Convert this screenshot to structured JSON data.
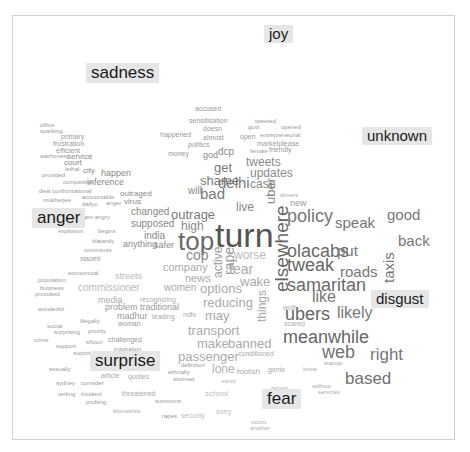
{
  "chart_data": {
    "type": "comparison word cloud",
    "title": "",
    "categories": [
      "joy",
      "sadness",
      "unknown",
      "anger",
      "disgust",
      "surprise",
      "fear"
    ],
    "category_labels": [
      {
        "text": "joy",
        "x": 264,
        "y": 25,
        "size": 15
      },
      {
        "text": "sadness",
        "x": 86,
        "y": 63,
        "size": 17
      },
      {
        "text": "unknown",
        "x": 362,
        "y": 127,
        "size": 15
      },
      {
        "text": "anger",
        "x": 32,
        "y": 208,
        "size": 17
      },
      {
        "text": "disgust",
        "x": 371,
        "y": 290,
        "size": 15
      },
      {
        "text": "surprise",
        "x": 90,
        "y": 351,
        "size": 17
      },
      {
        "text": "fear",
        "x": 262,
        "y": 389,
        "size": 17
      }
    ],
    "words": [
      {
        "t": "turn",
        "x": 215,
        "y": 218,
        "s": 34,
        "c": "#555555"
      },
      {
        "t": "top",
        "x": 178,
        "y": 228,
        "s": 26,
        "c": "#6a6a6a"
      },
      {
        "t": "policy",
        "x": 287,
        "y": 207,
        "s": 18,
        "c": "#777777"
      },
      {
        "t": "elsewhere",
        "x": 272,
        "y": 292,
        "s": 19,
        "c": "#666666",
        "rot": -90
      },
      {
        "t": "olacabs",
        "x": 287,
        "y": 242,
        "s": 18,
        "c": "#6a6a6a"
      },
      {
        "t": "tweak",
        "x": 287,
        "y": 256,
        "s": 18,
        "c": "#666666"
      },
      {
        "t": "samaritan",
        "x": 287,
        "y": 276,
        "s": 18,
        "c": "#6a6a6a"
      },
      {
        "t": "ubers",
        "x": 285,
        "y": 305,
        "s": 18,
        "c": "#666666"
      },
      {
        "t": "meanwhile",
        "x": 283,
        "y": 328,
        "s": 18,
        "c": "#666666"
      },
      {
        "t": "web",
        "x": 322,
        "y": 343,
        "s": 18,
        "c": "#707070"
      },
      {
        "t": "based",
        "x": 345,
        "y": 370,
        "s": 17,
        "c": "#707070"
      },
      {
        "t": "right",
        "x": 370,
        "y": 346,
        "s": 17,
        "c": "#777777"
      },
      {
        "t": "likely",
        "x": 337,
        "y": 305,
        "s": 16,
        "c": "#777777"
      },
      {
        "t": "like",
        "x": 312,
        "y": 289,
        "s": 16,
        "c": "#777777"
      },
      {
        "t": "speak",
        "x": 335,
        "y": 215,
        "s": 15,
        "c": "#777777"
      },
      {
        "t": "good",
        "x": 387,
        "y": 207,
        "s": 15,
        "c": "#7a7a7a"
      },
      {
        "t": "back",
        "x": 398,
        "y": 233,
        "s": 15,
        "c": "#777777"
      },
      {
        "t": "put",
        "x": 337,
        "y": 243,
        "s": 15,
        "c": "#777777"
      },
      {
        "t": "roads",
        "x": 340,
        "y": 264,
        "s": 15,
        "c": "#777777"
      },
      {
        "t": "taxis",
        "x": 381,
        "y": 283,
        "s": 15,
        "c": "#777777",
        "rot": -90
      },
      {
        "t": "uber",
        "x": 264,
        "y": 204,
        "s": 13,
        "c": "#888888",
        "rot": -90
      },
      {
        "t": "new",
        "x": 290,
        "y": 199,
        "s": 9,
        "c": "#999999"
      },
      {
        "t": "drivers",
        "x": 280,
        "y": 192,
        "s": 6,
        "c": "#aaaaaa"
      },
      {
        "t": "tweets",
        "x": 246,
        "y": 156,
        "s": 12,
        "c": "#8a8a8a"
      },
      {
        "t": "updates",
        "x": 250,
        "y": 167,
        "s": 12,
        "c": "#8a8a8a"
      },
      {
        "t": "case",
        "x": 250,
        "y": 178,
        "s": 12,
        "c": "#8a8a8a"
      },
      {
        "t": "delhi",
        "x": 218,
        "y": 175,
        "s": 15,
        "c": "#7a7a7a"
      },
      {
        "t": "get",
        "x": 214,
        "y": 161,
        "s": 13,
        "c": "#7a7a7a"
      },
      {
        "t": "shame",
        "x": 200,
        "y": 174,
        "s": 13,
        "c": "#7a7a7a"
      },
      {
        "t": "bad",
        "x": 200,
        "y": 186,
        "s": 15,
        "c": "#7a7a7a"
      },
      {
        "t": "will",
        "x": 188,
        "y": 186,
        "s": 10,
        "c": "#888888"
      },
      {
        "t": "live",
        "x": 236,
        "y": 201,
        "s": 12,
        "c": "#888888"
      },
      {
        "t": "outrage",
        "x": 171,
        "y": 208,
        "s": 13,
        "c": "#7a7a7a"
      },
      {
        "t": "high",
        "x": 181,
        "y": 220,
        "s": 12,
        "c": "#888888"
      },
      {
        "t": "cop",
        "x": 186,
        "y": 248,
        "s": 14,
        "c": "#888888"
      },
      {
        "t": "active",
        "x": 212,
        "y": 278,
        "s": 12,
        "c": "#999999",
        "rot": -90
      },
      {
        "t": "rape",
        "x": 222,
        "y": 275,
        "s": 14,
        "c": "#999999",
        "rot": -90
      },
      {
        "t": "fear",
        "x": 229,
        "y": 262,
        "s": 14,
        "c": "#aaaaaa"
      },
      {
        "t": "worse",
        "x": 234,
        "y": 249,
        "s": 12,
        "c": "#bbbbbb"
      },
      {
        "t": "wake",
        "x": 240,
        "y": 275,
        "s": 13,
        "c": "#aaaaaa"
      },
      {
        "t": "options",
        "x": 200,
        "y": 282,
        "s": 13,
        "c": "#aaaaaa"
      },
      {
        "t": "reducing",
        "x": 203,
        "y": 296,
        "s": 13,
        "c": "#aaaaaa"
      },
      {
        "t": "may",
        "x": 205,
        "y": 309,
        "s": 13,
        "c": "#aaaaaa"
      },
      {
        "t": "things",
        "x": 256,
        "y": 322,
        "s": 12,
        "c": "#aaaaaa",
        "rot": -90
      },
      {
        "t": "transport",
        "x": 188,
        "y": 324,
        "s": 13,
        "c": "#aaaaaa"
      },
      {
        "t": "make",
        "x": 197,
        "y": 337,
        "s": 13,
        "c": "#aaaaaa"
      },
      {
        "t": "banned",
        "x": 228,
        "y": 337,
        "s": 13,
        "c": "#aaaaaa"
      },
      {
        "t": "passenger",
        "x": 178,
        "y": 350,
        "s": 13,
        "c": "#aaaaaa"
      },
      {
        "t": "lone",
        "x": 212,
        "y": 363,
        "s": 12,
        "c": "#b0b0b0"
      },
      {
        "t": "company",
        "x": 163,
        "y": 262,
        "s": 11,
        "c": "#aaaaaa"
      },
      {
        "t": "news",
        "x": 185,
        "y": 273,
        "s": 11,
        "c": "#aaaaaa"
      },
      {
        "t": "women",
        "x": 164,
        "y": 283,
        "s": 10,
        "c": "#aaaaaa"
      },
      {
        "t": "changed",
        "x": 131,
        "y": 207,
        "s": 10,
        "c": "#888888"
      },
      {
        "t": "supposed",
        "x": 131,
        "y": 219,
        "s": 10,
        "c": "#888888"
      },
      {
        "t": "india",
        "x": 144,
        "y": 231,
        "s": 10,
        "c": "#888888"
      },
      {
        "t": "anything",
        "x": 123,
        "y": 240,
        "s": 9,
        "c": "#888888"
      },
      {
        "t": "safer",
        "x": 154,
        "y": 241,
        "s": 9,
        "c": "#888888"
      },
      {
        "t": "outraged",
        "x": 120,
        "y": 190,
        "s": 8,
        "c": "#888888"
      },
      {
        "t": "virus",
        "x": 124,
        "y": 198,
        "s": 8,
        "c": "#888888"
      },
      {
        "t": "inference",
        "x": 87,
        "y": 178,
        "s": 9,
        "c": "#888888"
      },
      {
        "t": "happen",
        "x": 101,
        "y": 169,
        "s": 9,
        "c": "#888888"
      },
      {
        "t": "court",
        "x": 64,
        "y": 159,
        "s": 8,
        "c": "#888888"
      },
      {
        "t": "service",
        "x": 67,
        "y": 153,
        "s": 8,
        "c": "#888888"
      },
      {
        "t": "city",
        "x": 83,
        "y": 167,
        "s": 8,
        "c": "#888888"
      },
      {
        "t": "xiaomi",
        "x": 80,
        "y": 255,
        "s": 7,
        "c": "#999999"
      },
      {
        "t": "streets",
        "x": 115,
        "y": 272,
        "s": 9,
        "c": "#bbbbbb"
      },
      {
        "t": "commissioner",
        "x": 78,
        "y": 283,
        "s": 10,
        "c": "#bbbbbb"
      },
      {
        "t": "media",
        "x": 98,
        "y": 296,
        "s": 9,
        "c": "#aaaaaa"
      },
      {
        "t": "problem",
        "x": 105,
        "y": 303,
        "s": 9,
        "c": "#999999"
      },
      {
        "t": "traditional",
        "x": 140,
        "y": 303,
        "s": 9,
        "c": "#999999"
      },
      {
        "t": "madhur",
        "x": 117,
        "y": 312,
        "s": 9,
        "c": "#999999"
      },
      {
        "t": "woman",
        "x": 118,
        "y": 320,
        "s": 7,
        "c": "#999999"
      },
      {
        "t": "challenged",
        "x": 108,
        "y": 336,
        "s": 7,
        "c": "#999999"
      },
      {
        "t": "quotes",
        "x": 128,
        "y": 373,
        "s": 7,
        "c": "#aaaaaa"
      },
      {
        "t": "article",
        "x": 101,
        "y": 372,
        "s": 7,
        "c": "#aaaaaa"
      },
      {
        "t": "threatened",
        "x": 122,
        "y": 390,
        "s": 7,
        "c": "#aaaaaa"
      },
      {
        "t": "biometrics",
        "x": 113,
        "y": 408,
        "s": 6,
        "c": "#aaaaaa"
      },
      {
        "t": "security",
        "x": 181,
        "y": 412,
        "s": 7,
        "c": "#bbbbbb"
      },
      {
        "t": "sorry",
        "x": 216,
        "y": 408,
        "s": 7,
        "c": "#bbbbbb"
      },
      {
        "t": "school",
        "x": 205,
        "y": 390,
        "s": 8,
        "c": "#bbbbbb"
      },
      {
        "t": "foolish",
        "x": 237,
        "y": 368,
        "s": 8,
        "c": "#aaaaaa"
      },
      {
        "t": "genie",
        "x": 268,
        "y": 366,
        "s": 7,
        "c": "#aaaaaa"
      },
      {
        "t": "conditioned",
        "x": 238,
        "y": 350,
        "s": 7,
        "c": "#aaaaaa"
      },
      {
        "t": "scared",
        "x": 284,
        "y": 320,
        "s": 7,
        "c": "#aaaaaa"
      },
      {
        "t": "wolf",
        "x": 283,
        "y": 304,
        "s": 7,
        "c": "#aaaaaa"
      },
      {
        "t": "startup",
        "x": 324,
        "y": 360,
        "s": 6,
        "c": "#aaaaaa"
      },
      {
        "t": "know",
        "x": 303,
        "y": 366,
        "s": 6,
        "c": "#aaaaaa"
      },
      {
        "t": "without",
        "x": 312,
        "y": 383,
        "s": 6,
        "c": "#aaaaaa"
      },
      {
        "t": "services",
        "x": 318,
        "y": 389,
        "s": 6,
        "c": "#aaaaaa"
      },
      {
        "t": "accused",
        "x": 195,
        "y": 105,
        "s": 7,
        "c": "#999999"
      },
      {
        "t": "sensitisation",
        "x": 189,
        "y": 117,
        "s": 7,
        "c": "#999999"
      },
      {
        "t": "doesn",
        "x": 203,
        "y": 125,
        "s": 7,
        "c": "#999999"
      },
      {
        "t": "happened",
        "x": 160,
        "y": 131,
        "s": 7,
        "c": "#999999"
      },
      {
        "t": "almost",
        "x": 203,
        "y": 134,
        "s": 7,
        "c": "#999999"
      },
      {
        "t": "politics",
        "x": 188,
        "y": 141,
        "s": 7,
        "c": "#999999"
      },
      {
        "t": "money",
        "x": 168,
        "y": 150,
        "s": 7,
        "c": "#999999"
      },
      {
        "t": "god",
        "x": 203,
        "y": 151,
        "s": 9,
        "c": "#888888"
      },
      {
        "t": "dcp",
        "x": 218,
        "y": 147,
        "s": 10,
        "c": "#888888"
      },
      {
        "t": "tweeted",
        "x": 255,
        "y": 118,
        "s": 6,
        "c": "#999999"
      },
      {
        "t": "opened",
        "x": 281,
        "y": 124,
        "s": 6,
        "c": "#999999"
      },
      {
        "t": "govt",
        "x": 248,
        "y": 124,
        "s": 6,
        "c": "#999999"
      },
      {
        "t": "open",
        "x": 240,
        "y": 133,
        "s": 7,
        "c": "#999999"
      },
      {
        "t": "entrepreneurial",
        "x": 260,
        "y": 132,
        "s": 6,
        "c": "#999999"
      },
      {
        "t": "marketplease",
        "x": 257,
        "y": 140,
        "s": 7,
        "c": "#999999"
      },
      {
        "t": "friendly",
        "x": 269,
        "y": 146,
        "s": 7,
        "c": "#999999"
      },
      {
        "t": "female",
        "x": 250,
        "y": 148,
        "s": 6,
        "c": "#999999"
      },
      {
        "t": "office",
        "x": 40,
        "y": 122,
        "s": 6,
        "c": "#999999"
      },
      {
        "t": "sparking",
        "x": 40,
        "y": 128,
        "s": 6,
        "c": "#999999"
      },
      {
        "t": "primary",
        "x": 61,
        "y": 133,
        "s": 7,
        "c": "#999999"
      },
      {
        "t": "frustration",
        "x": 53,
        "y": 140,
        "s": 7,
        "c": "#999999"
      },
      {
        "t": "efficient",
        "x": 56,
        "y": 147,
        "s": 7,
        "c": "#999999"
      },
      {
        "t": "war",
        "x": 40,
        "y": 153,
        "s": 6,
        "c": "#999999"
      },
      {
        "t": "honest",
        "x": 50,
        "y": 153,
        "s": 6,
        "c": "#999999"
      },
      {
        "t": "provided",
        "x": 42,
        "y": 172,
        "s": 6,
        "c": "#999999"
      },
      {
        "t": "lethal",
        "x": 65,
        "y": 166,
        "s": 6,
        "c": "#999999"
      },
      {
        "t": "competitive",
        "x": 63,
        "y": 179,
        "s": 6,
        "c": "#999999"
      },
      {
        "t": "deal",
        "x": 39,
        "y": 188,
        "s": 6,
        "c": "#999999"
      },
      {
        "t": "confrontational",
        "x": 52,
        "y": 188,
        "s": 6,
        "c": "#999999"
      },
      {
        "t": "mukherjee",
        "x": 43,
        "y": 197,
        "s": 6,
        "c": "#999999"
      },
      {
        "t": "accountable",
        "x": 82,
        "y": 194,
        "s": 6,
        "c": "#999999"
      },
      {
        "t": "dailyo",
        "x": 82,
        "y": 201,
        "s": 6,
        "c": "#999999"
      },
      {
        "t": "anger",
        "x": 106,
        "y": 200,
        "s": 6,
        "c": "#999999"
      },
      {
        "t": "gen angry",
        "x": 83,
        "y": 214,
        "s": 6,
        "c": "#999999"
      },
      {
        "t": "begins",
        "x": 98,
        "y": 228,
        "s": 6,
        "c": "#999999"
      },
      {
        "t": "explosion",
        "x": 58,
        "y": 228,
        "s": 6,
        "c": "#999999"
      },
      {
        "t": "blatantly",
        "x": 92,
        "y": 238,
        "s": 6,
        "c": "#999999"
      },
      {
        "t": "comments",
        "x": 84,
        "y": 247,
        "s": 6,
        "c": "#999999"
      },
      {
        "t": "economical",
        "x": 68,
        "y": 270,
        "s": 6,
        "c": "#999999"
      },
      {
        "t": "population",
        "x": 38,
        "y": 277,
        "s": 6,
        "c": "#999999"
      },
      {
        "t": "business",
        "x": 40,
        "y": 285,
        "s": 6,
        "c": "#999999"
      },
      {
        "t": "provoked",
        "x": 35,
        "y": 291,
        "s": 6,
        "c": "#999999"
      },
      {
        "t": "wonderful",
        "x": 38,
        "y": 306,
        "s": 6,
        "c": "#999999"
      },
      {
        "t": "illegally",
        "x": 80,
        "y": 318,
        "s": 6,
        "c": "#999999"
      },
      {
        "t": "social",
        "x": 47,
        "y": 323,
        "s": 6,
        "c": "#999999"
      },
      {
        "t": "surprising",
        "x": 54,
        "y": 329,
        "s": 6,
        "c": "#999999"
      },
      {
        "t": "priority",
        "x": 88,
        "y": 328,
        "s": 6,
        "c": "#999999"
      },
      {
        "t": "silicon",
        "x": 86,
        "y": 339,
        "s": 6,
        "c": "#999999"
      },
      {
        "t": "crime",
        "x": 34,
        "y": 337,
        "s": 6,
        "c": "#999999"
      },
      {
        "t": "support",
        "x": 56,
        "y": 343,
        "s": 6,
        "c": "#999999"
      },
      {
        "t": "surprised",
        "x": 73,
        "y": 350,
        "s": 6,
        "c": "#999999"
      },
      {
        "t": "inspiration",
        "x": 114,
        "y": 346,
        "s": 6,
        "c": "#999999"
      },
      {
        "t": "sexually",
        "x": 49,
        "y": 366,
        "s": 6,
        "c": "#999999"
      },
      {
        "t": "sydney",
        "x": 56,
        "y": 380,
        "s": 6,
        "c": "#999999"
      },
      {
        "t": "consider",
        "x": 81,
        "y": 380,
        "s": 6,
        "c": "#999999"
      },
      {
        "t": "writing",
        "x": 58,
        "y": 391,
        "s": 6,
        "c": "#999999"
      },
      {
        "t": "incident",
        "x": 81,
        "y": 391,
        "s": 6,
        "c": "#999999"
      },
      {
        "t": "probing",
        "x": 86,
        "y": 399,
        "s": 6,
        "c": "#999999"
      },
      {
        "t": "summons",
        "x": 155,
        "y": 398,
        "s": 6,
        "c": "#999999"
      },
      {
        "t": "rapes",
        "x": 162,
        "y": 413,
        "s": 6,
        "c": "#999999"
      },
      {
        "t": "stunned",
        "x": 173,
        "y": 376,
        "s": 6,
        "c": "#999999"
      },
      {
        "t": "ethically",
        "x": 168,
        "y": 369,
        "s": 6,
        "c": "#999999"
      },
      {
        "t": "definition",
        "x": 181,
        "y": 362,
        "s": 6,
        "c": "#999999"
      },
      {
        "t": "minor",
        "x": 221,
        "y": 378,
        "s": 6,
        "c": "#aaaaaa"
      },
      {
        "t": "recent",
        "x": 271,
        "y": 385,
        "s": 6,
        "c": "#aaaaaa"
      },
      {
        "t": "victim",
        "x": 251,
        "y": 419,
        "s": 6,
        "c": "#aaaaaa"
      },
      {
        "t": "another",
        "x": 250,
        "y": 425,
        "s": 6,
        "c": "#aaaaaa"
      },
      {
        "t": "ndtv",
        "x": 183,
        "y": 311,
        "s": 7,
        "c": "#aaaaaa"
      },
      {
        "t": "recognizing",
        "x": 140,
        "y": 296,
        "s": 7,
        "c": "#aaaaaa"
      },
      {
        "t": "leading",
        "x": 152,
        "y": 313,
        "s": 7,
        "c": "#aaaaaa"
      }
    ]
  }
}
